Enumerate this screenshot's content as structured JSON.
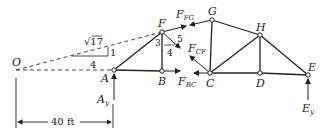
{
  "diagram": {
    "type": "truss free-body diagram",
    "joints": [
      {
        "id": "O",
        "label": "O",
        "x": 16,
        "y": 70
      },
      {
        "id": "A",
        "label": "A",
        "x": 114,
        "y": 70
      },
      {
        "id": "F",
        "label": "F",
        "x": 162,
        "y": 32
      },
      {
        "id": "B",
        "label": "B",
        "x": 162,
        "y": 71
      },
      {
        "id": "G",
        "label": "G",
        "x": 212,
        "y": 20
      },
      {
        "id": "C",
        "label": "C",
        "x": 210,
        "y": 73
      },
      {
        "id": "H",
        "label": "H",
        "x": 260,
        "y": 35
      },
      {
        "id": "D",
        "label": "D",
        "x": 260,
        "y": 73
      },
      {
        "id": "E",
        "label": "E",
        "x": 308,
        "y": 75
      }
    ],
    "members": [
      [
        "A",
        "F"
      ],
      [
        "A",
        "B"
      ],
      [
        "F",
        "B"
      ],
      [
        "G",
        "C"
      ],
      [
        "G",
        "H"
      ],
      [
        "C",
        "H"
      ],
      [
        "C",
        "D"
      ],
      [
        "H",
        "D"
      ],
      [
        "H",
        "E"
      ],
      [
        "D",
        "E"
      ],
      [
        "F",
        "G_cut"
      ]
    ],
    "forces": {
      "F_FG": {
        "label": "F",
        "sub": "FG"
      },
      "F_CF": {
        "label": "F",
        "sub": "CF"
      },
      "F_BC": {
        "label": "F",
        "sub": "BC"
      },
      "A_y": {
        "label": "A",
        "sub": "y"
      },
      "E_y": {
        "label": "E",
        "sub": "y"
      }
    },
    "slope_triangle_FG": {
      "hyp": "√17",
      "rise": "1",
      "run": "4"
    },
    "slope_triangle_CF": {
      "hyp": "5",
      "rise": "3",
      "run": "4"
    },
    "dimension": {
      "label": "40 ft"
    }
  }
}
